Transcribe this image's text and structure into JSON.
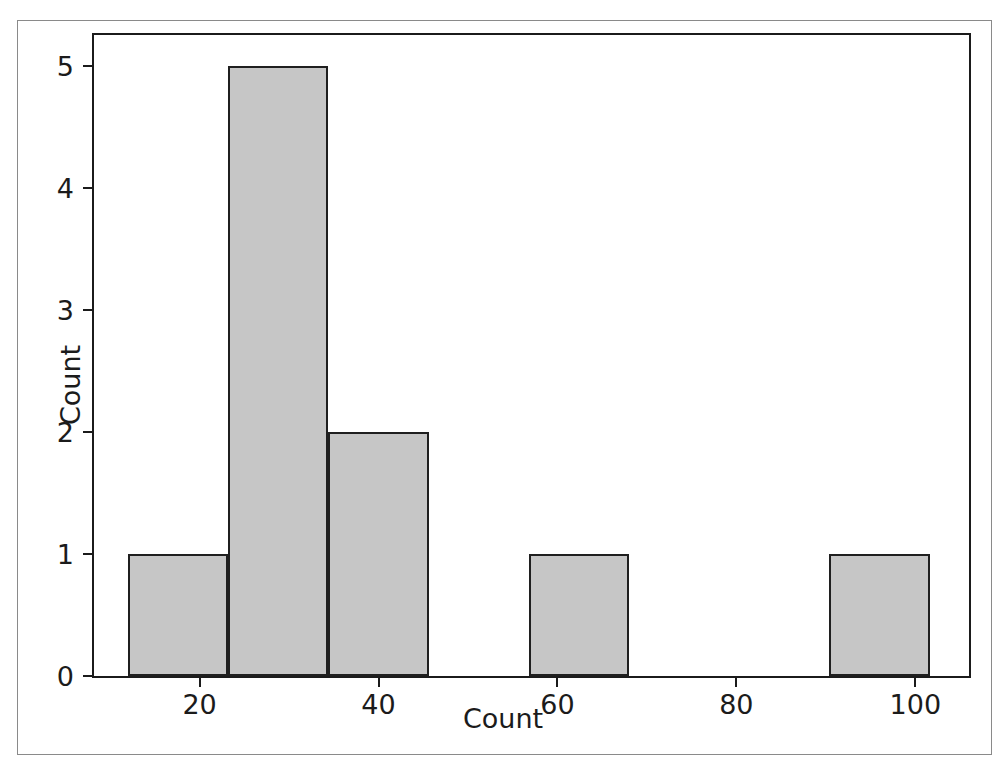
{
  "figure": {
    "background_color": "#ffffff",
    "frame_color": "#8a8a8a",
    "axes_color": "#1b1b1b"
  },
  "chart_data": {
    "type": "bar",
    "subtype": "histogram",
    "title": "",
    "xlabel": "Count",
    "ylabel": "Count",
    "xlim": [
      8.2,
      106.0
    ],
    "ylim": [
      0,
      5.25
    ],
    "xticks": [
      20,
      40,
      60,
      80,
      100
    ],
    "yticks": [
      0,
      1,
      2,
      3,
      4,
      5
    ],
    "xtick_labels": [
      "20",
      "40",
      "60",
      "80",
      "100"
    ],
    "ytick_labels": [
      "0",
      "1",
      "2",
      "3",
      "4",
      "5"
    ],
    "grid": false,
    "legend": null,
    "bar_fill_color": "#c6c6c6",
    "bar_edge_color": "#1f1f1f",
    "bin_edges": [
      12.0,
      23.2,
      34.4,
      45.6,
      56.8,
      68.0,
      79.2,
      90.4,
      101.6
    ],
    "bins": [
      {
        "label": "12.0-23.2",
        "x0": 12.0,
        "x1": 23.2,
        "value": 1
      },
      {
        "label": "23.2-34.4",
        "x0": 23.2,
        "x1": 34.4,
        "value": 5
      },
      {
        "label": "34.4-45.6",
        "x0": 34.4,
        "x1": 45.6,
        "value": 2
      },
      {
        "label": "45.6-56.8",
        "x0": 45.6,
        "x1": 56.8,
        "value": 0
      },
      {
        "label": "56.8-68.0",
        "x0": 56.8,
        "x1": 68.0,
        "value": 1
      },
      {
        "label": "68.0-79.2",
        "x0": 68.0,
        "x1": 79.2,
        "value": 0
      },
      {
        "label": "79.2-90.4",
        "x0": 79.2,
        "x1": 90.4,
        "value": 0
      },
      {
        "label": "90.4-101.6",
        "x0": 90.4,
        "x1": 101.6,
        "value": 1
      }
    ],
    "categories": [
      "12.0-23.2",
      "23.2-34.4",
      "34.4-45.6",
      "45.6-56.8",
      "56.8-68.0",
      "68.0-79.2",
      "79.2-90.4",
      "90.4-101.6"
    ],
    "values": [
      1,
      5,
      2,
      0,
      1,
      0,
      0,
      1
    ],
    "total_count": 10
  }
}
